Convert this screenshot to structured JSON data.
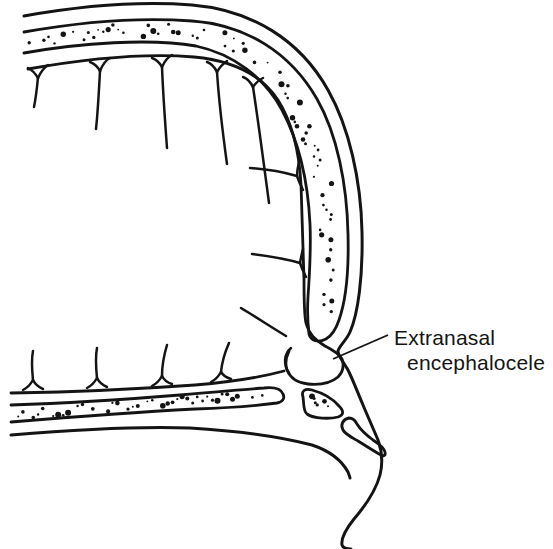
{
  "figure": {
    "label": {
      "line1": "Extranasal",
      "line2": "encephalocele"
    },
    "colors": {
      "ink": "#141414",
      "background": "#ffffff"
    },
    "structures": [
      "calvaria-outer-table",
      "diploe-marrow-stipple",
      "calvaria-inner-table",
      "cerebral-gyri-and-sulci",
      "anterior-skull-base",
      "extranasal-encephalocele",
      "nasal-bone",
      "septal-cartilage",
      "nose-soft-tissue-profile"
    ]
  }
}
